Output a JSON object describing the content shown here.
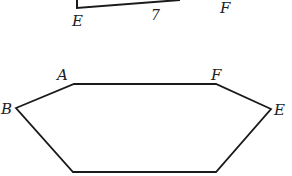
{
  "figures": {
    "top_fragment": {
      "description": "partial quadrilateral cut off at top edge",
      "labels": {
        "left_vertex": "E",
        "right_vertex": "F"
      },
      "side_length": "7"
    },
    "hexagon": {
      "labels": {
        "top_left": "A",
        "top_right": "F",
        "left": "B",
        "right": "E"
      }
    }
  },
  "colors": {
    "stroke": "#1a1a1a",
    "text": "#222222",
    "background": "#ffffff"
  }
}
